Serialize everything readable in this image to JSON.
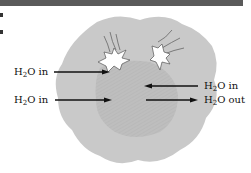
{
  "figure": {
    "type": "water-flow-diagram",
    "colors": {
      "top_bar": "#5a5a5a",
      "outer_blob": "#c8c8c8",
      "inner_region": "#bdbdbd",
      "arrow": "#111111",
      "crack_fill": "#ffffff"
    },
    "labels": {
      "left_top": {
        "prefix": "H",
        "sub": "2",
        "suffix": "O in",
        "direction": "right"
      },
      "left_bottom": {
        "prefix": "H",
        "sub": "2",
        "suffix": "O in",
        "direction": "right"
      },
      "right_top": {
        "prefix": "H",
        "sub": "2",
        "suffix": "O in",
        "direction": "left"
      },
      "right_bottom": {
        "prefix": "H",
        "sub": "2",
        "suffix": "O out",
        "direction": "right"
      }
    },
    "icons": [
      "crack-burst-icon",
      "crack-burst-icon"
    ]
  }
}
